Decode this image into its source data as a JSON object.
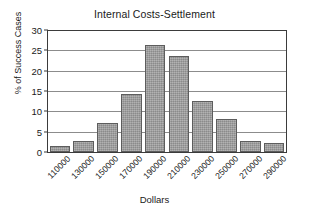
{
  "chart_data": {
    "type": "bar",
    "title": "Internal Costs-Settlement",
    "xlabel": "Dollars",
    "ylabel": "% of Success Cases",
    "categories": [
      "110000",
      "130000",
      "150000",
      "170000",
      "190000",
      "210000",
      "230000",
      "250000",
      "270000",
      "290000"
    ],
    "values": [
      1.6,
      2.8,
      7.1,
      14.2,
      26.4,
      23.6,
      12.6,
      8.0,
      2.6,
      2.1
    ],
    "ylim": [
      0,
      30
    ],
    "yticks": [
      0,
      5,
      10,
      15,
      20,
      25,
      30
    ],
    "ytick_labels": [
      "0",
      "5",
      "10",
      "15",
      "20",
      "25",
      "30"
    ],
    "grid": true,
    "grid_axis": "y",
    "legend": false,
    "bar_color": "#9b9b9b",
    "bar_edge_color": "#5d5d5d",
    "axis_color": "#3b3b3b",
    "grid_color": "#8c8c8c",
    "background_color": "#ffffff",
    "xtick_rotation": -45
  }
}
